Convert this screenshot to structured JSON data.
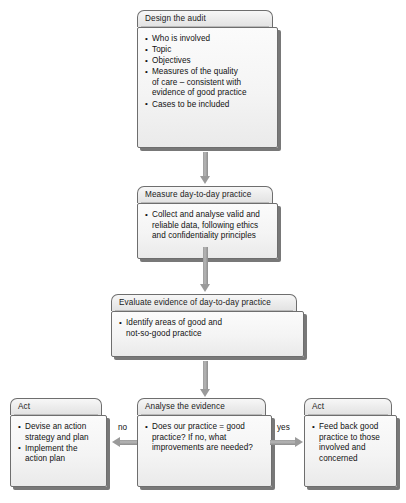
{
  "diagram": {
    "colors": {
      "header_fill": "#ededed",
      "body_fill": "#f4f4f4",
      "border": "#6e6e6e",
      "shadow": "#5a5a5a",
      "arrow": "#9a9a9a",
      "text": "#111111",
      "background": "#ffffff"
    },
    "nodes": [
      {
        "id": "design",
        "header": "Design the audit",
        "items": [
          {
            "text": "Who is involved",
            "lines": [
              "Who is involved"
            ]
          },
          {
            "text": "Topic",
            "lines": [
              "Topic"
            ]
          },
          {
            "text": "Objectives",
            "lines": [
              "Objectives"
            ]
          },
          {
            "text": "Measures of the quality of care – consistent with evidence of good practice",
            "lines": [
              "Measures of the quality",
              "of care – consistent with",
              "evidence of good practice"
            ]
          },
          {
            "text": "Cases to be included",
            "lines": [
              "Cases to be included"
            ]
          }
        ]
      },
      {
        "id": "measure",
        "header": "Measure day-to-day practice",
        "items": [
          {
            "text": "Collect and analyse valid and reliable data, following ethics and confidentiality principles",
            "lines": [
              "Collect and analyse valid and",
              "reliable data, following ethics",
              "and confidentiality principles"
            ]
          }
        ]
      },
      {
        "id": "evaluate",
        "header": "Evaluate evidence of day-to-day practice",
        "items": [
          {
            "text": "Identify areas of good and not-so-good practice",
            "lines": [
              "Identify areas of good and",
              "not-so-good practice"
            ]
          }
        ]
      },
      {
        "id": "act-left",
        "header": "Act",
        "items": [
          {
            "text": "Devise an action strategy and plan",
            "lines": [
              "Devise an action",
              "strategy and plan"
            ]
          },
          {
            "text": "Implement the action plan",
            "lines": [
              "Implement the",
              "action plan"
            ]
          }
        ]
      },
      {
        "id": "analyse",
        "header": "Analyse the evidence",
        "items": [
          {
            "text": "Does our practice = good practice? If no, what improvements are needed?",
            "lines": [
              "Does our practice = good",
              "practice? If no, what",
              "improvements are needed?"
            ]
          }
        ]
      },
      {
        "id": "act-right",
        "header": "Act",
        "items": [
          {
            "text": "Feed back good practice to those involved and concerned",
            "lines": [
              "Feed back good",
              "practice to those",
              "involved and",
              "concerned"
            ]
          }
        ]
      }
    ],
    "edges": [
      {
        "id": "design-measure",
        "from": "design",
        "to": "measure",
        "label": "",
        "direction": "down"
      },
      {
        "id": "measure-evaluate",
        "from": "measure",
        "to": "evaluate",
        "label": "",
        "direction": "down"
      },
      {
        "id": "evaluate-analyse",
        "from": "evaluate",
        "to": "analyse",
        "label": "",
        "direction": "down"
      },
      {
        "id": "analyse-act-left",
        "from": "analyse",
        "to": "act-left",
        "label": "no",
        "direction": "left"
      },
      {
        "id": "analyse-act-right",
        "from": "analyse",
        "to": "act-right",
        "label": "yes",
        "direction": "right"
      }
    ]
  }
}
